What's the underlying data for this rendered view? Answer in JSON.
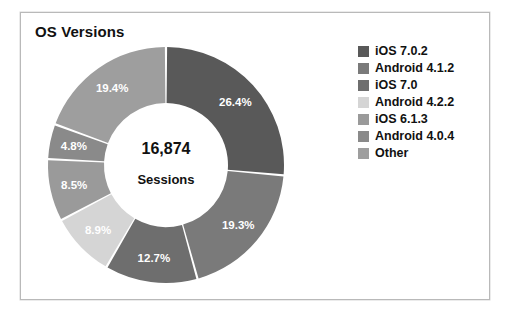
{
  "panel": {
    "title": "OS Versions"
  },
  "center": {
    "total": "16,874",
    "caption": "Sessions"
  },
  "chart_data": {
    "type": "pie",
    "title": "OS Versions",
    "variant": "donut",
    "center_value": "16,874",
    "center_label": "Sessions",
    "total_sessions": 16874,
    "units": "percent",
    "start_angle_deg": 0,
    "direction": "clockwise",
    "legend_position": "right",
    "grid": false,
    "xlabel": "",
    "ylabel": "",
    "categories": [
      "iOS 7.0.2",
      "Android 4.1.2",
      "iOS 7.0",
      "Android 4.2.2",
      "iOS 6.1.3",
      "Android 4.0.4",
      "Other"
    ],
    "values": [
      26.4,
      19.3,
      12.7,
      8.9,
      8.5,
      4.8,
      19.4
    ],
    "labels": [
      "26.4%",
      "19.3%",
      "12.7%",
      "8.9%",
      "8.5%",
      "4.8%",
      "19.4%"
    ],
    "colors": [
      "#595959",
      "#7a7a7a",
      "#6e6e6e",
      "#d5d5d5",
      "#9a9a9a",
      "#8a8a8a",
      "#9e9e9e"
    ],
    "slices": [
      {
        "name": "iOS 7.0.2",
        "value": 26.4,
        "label": "26.4%",
        "color": "#595959"
      },
      {
        "name": "Android 4.1.2",
        "value": 19.3,
        "label": "19.3%",
        "color": "#7a7a7a"
      },
      {
        "name": "iOS 7.0",
        "value": 12.7,
        "label": "12.7%",
        "color": "#6e6e6e"
      },
      {
        "name": "Android 4.2.2",
        "value": 8.9,
        "label": "8.9%",
        "color": "#d5d5d5"
      },
      {
        "name": "iOS 6.1.3",
        "value": 8.5,
        "label": "8.5%",
        "color": "#9a9a9a"
      },
      {
        "name": "Android 4.0.4",
        "value": 4.8,
        "label": "4.8%",
        "color": "#8a8a8a"
      },
      {
        "name": "Other",
        "value": 19.4,
        "label": "19.4%",
        "color": "#9e9e9e"
      }
    ]
  },
  "legend": {
    "items": [
      {
        "label": "iOS 7.0.2",
        "color": "#595959"
      },
      {
        "label": "Android 4.1.2",
        "color": "#7a7a7a"
      },
      {
        "label": "iOS 7.0",
        "color": "#6e6e6e"
      },
      {
        "label": "Android 4.2.2",
        "color": "#d5d5d5"
      },
      {
        "label": "iOS 6.1.3",
        "color": "#9a9a9a"
      },
      {
        "label": "Android 4.0.4",
        "color": "#8a8a8a"
      },
      {
        "label": "Other",
        "color": "#9e9e9e"
      }
    ]
  }
}
